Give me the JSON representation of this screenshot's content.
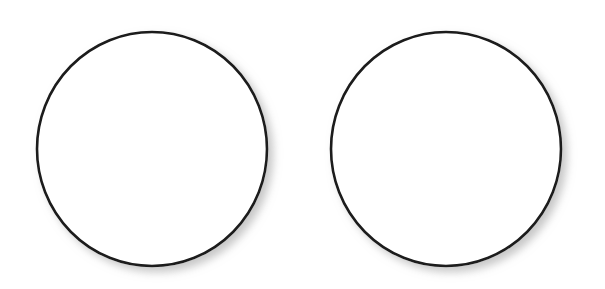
{
  "figure": {
    "title": "",
    "background_color": "#ffffff",
    "width": 605,
    "height": 289,
    "shape_count": "2"
  },
  "style": {
    "stroke_color": "#1b1b1b",
    "fill_color": "#ffffff",
    "stroke_width": "2.6",
    "shadow_color": "#9a9a9a",
    "shadow_offset_x": "5",
    "shadow_offset_y": "5",
    "shadow_blur": "5"
  },
  "chart_data": {
    "type": "scatter",
    "title": "",
    "subtitle": "",
    "xlabel": "",
    "ylabel": "",
    "grid": false,
    "legend": "none",
    "xlim": [
      0,
      605
    ],
    "ylim": [
      0,
      289
    ],
    "shapes": [
      {
        "name": "left-circle",
        "kind": "circle",
        "cx": 152,
        "cy": 149,
        "rx": 115,
        "ry": 117,
        "filled": false,
        "label": ""
      },
      {
        "name": "right-circle",
        "kind": "circle",
        "cx": 446,
        "cy": 149,
        "rx": 115,
        "ry": 117,
        "filled": false,
        "label": ""
      }
    ]
  }
}
